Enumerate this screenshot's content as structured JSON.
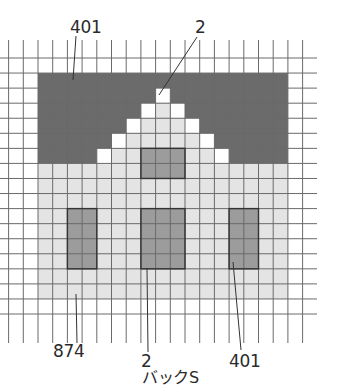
{
  "chart_data": {
    "type": "diagram",
    "title": "",
    "grid": {
      "cols": 21,
      "rows": 18,
      "cell_w": 14.7,
      "cell_h": 15.06,
      "origin_x": 8.6,
      "origin_y": 58,
      "vline_top": 40,
      "vline_bottom": 343,
      "hline_left": 0,
      "hline_right": 317
    },
    "colors": {
      "401": "#6b6b6b",
      "874": "#e4e4e4",
      "window": "#9c9c9c",
      "white": "#ffffff",
      "grid": "#555555"
    },
    "regions": [
      {
        "name": "roof-background",
        "thread": "401",
        "col": 2,
        "row": 1,
        "w": 17,
        "h": 6
      },
      {
        "name": "house-body",
        "thread": "874",
        "col": 2,
        "row": 7,
        "w": 17,
        "h": 9
      }
    ],
    "gable_rows": [
      {
        "row": 2,
        "white": [
          10
        ],
        "light": []
      },
      {
        "row": 3,
        "white": [
          9,
          11
        ],
        "light": [
          10
        ]
      },
      {
        "row": 4,
        "white": [
          8,
          12
        ],
        "light": [
          9,
          10,
          11
        ]
      },
      {
        "row": 5,
        "white": [
          7,
          13
        ],
        "light": [
          8,
          9,
          10,
          11,
          12
        ]
      },
      {
        "row": 6,
        "white": [
          6,
          14
        ],
        "light": [
          7,
          8,
          9,
          10,
          11,
          12,
          13
        ]
      }
    ],
    "windows": [
      {
        "name": "upper-window",
        "col": 9,
        "row": 6,
        "w": 3,
        "h": 2
      },
      {
        "name": "left-window",
        "col": 4,
        "row": 10,
        "w": 2,
        "h": 4
      },
      {
        "name": "center-window",
        "col": 9,
        "row": 10,
        "w": 3,
        "h": 4
      },
      {
        "name": "right-window",
        "col": 15,
        "row": 10,
        "w": 2,
        "h": 4
      }
    ],
    "annotations": [
      {
        "text": "401",
        "x": 70,
        "y": 20,
        "leader": [
          [
            76,
            36
          ],
          [
            73,
            80
          ]
        ]
      },
      {
        "text": "2",
        "x": 195,
        "y": 20,
        "leader": [
          [
            197,
            37
          ],
          [
            159,
            95
          ]
        ]
      },
      {
        "text": "874",
        "x": 53,
        "y": 343,
        "leader": [
          [
            77,
            343
          ],
          [
            76,
            294
          ]
        ]
      },
      {
        "text": "2",
        "x": 141,
        "y": 355,
        "leader": [
          [
            148,
            352
          ],
          [
            147,
            268
          ]
        ]
      },
      {
        "text": "バックS",
        "x": 142,
        "y": 372,
        "leader": null
      },
      {
        "text": "401",
        "x": 229,
        "y": 355,
        "leader": [
          [
            241,
            350
          ],
          [
            233,
            262
          ]
        ]
      }
    ]
  },
  "labels": {
    "top_left": "401",
    "top_right": "2",
    "bottom_left": "874",
    "bottom_center_number": "2",
    "bottom_center_text": "バックS",
    "bottom_right": "401"
  }
}
